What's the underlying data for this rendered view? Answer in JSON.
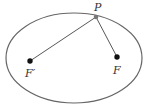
{
  "diagram": {
    "type": "ellipse-with-foci",
    "colors": {
      "ellipse_stroke": "#666666",
      "line": "#444444",
      "point": "#111111",
      "P_point": "#777777",
      "label": "#333333"
    },
    "ellipse": {
      "cx": 74,
      "cy": 58,
      "rx": 68,
      "ry": 45
    },
    "points": {
      "P": {
        "label": "P",
        "x": 96,
        "y": 17
      },
      "F_prime": {
        "label": "F′",
        "x": 30,
        "y": 61
      },
      "F": {
        "label": "F",
        "x": 117,
        "y": 57
      }
    }
  }
}
